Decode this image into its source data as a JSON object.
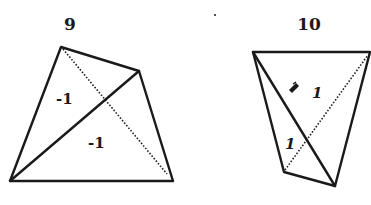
{
  "figures": [
    {
      "number": "9",
      "vertices": {
        "top": [
          61,
          47
        ],
        "right": [
          139,
          71
        ],
        "bottom_left": [
          10,
          181
        ],
        "bottom_right": [
          173,
          181
        ]
      },
      "solid_diagonal": [
        "bottom_left",
        "right"
      ],
      "dotted_diagonal": [
        "top",
        "bottom_right"
      ],
      "labels": [
        {
          "text": "-1",
          "x": 56,
          "y": 104
        },
        {
          "text": "-1",
          "x": 88,
          "y": 148
        }
      ]
    },
    {
      "number": "10",
      "vertices": {
        "top_left": [
          253,
          52
        ],
        "top_right": [
          370,
          52
        ],
        "bottom_right": [
          335,
          186
        ],
        "bottom_left": [
          284,
          172
        ]
      },
      "solid_diagonal": [
        "top_left",
        "bottom_right"
      ],
      "dotted_diagonal": [
        "bottom_left",
        "top_right"
      ],
      "labels": [
        {
          "text": "1",
          "x": 312,
          "y": 98
        },
        {
          "text": "1",
          "x": 285,
          "y": 149
        }
      ],
      "mark": "ink-blot"
    }
  ],
  "colors": {
    "ink": "#1a1a1a",
    "paper": "#ffffff"
  }
}
